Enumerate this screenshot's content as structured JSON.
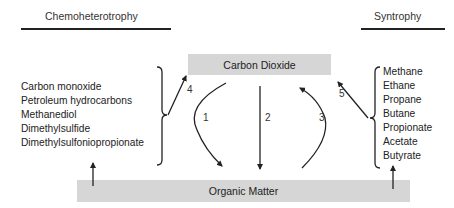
{
  "headers": {
    "left": "Chemoheterotrophy",
    "right": "Syntrophy"
  },
  "boxes": {
    "top": "Carbon Dioxide",
    "bottom": "Organic Matter"
  },
  "left_compounds": [
    "Carbon monoxide",
    "Petroleum hydrocarbons",
    "Methanediol",
    "Dimethylsulfide",
    "Dimethylsulfoniopropionate"
  ],
  "right_compounds": [
    "Methane",
    "Ethane",
    "Propane",
    "Butane",
    " Propionate",
    "Acetate",
    "Butyrate"
  ],
  "arrow_labels": {
    "a1": "1",
    "a2": "2",
    "a3": "3",
    "a4": "4",
    "a5": "5"
  },
  "colors": {
    "box_fill": "#d6d6d6",
    "line": "#222222"
  }
}
